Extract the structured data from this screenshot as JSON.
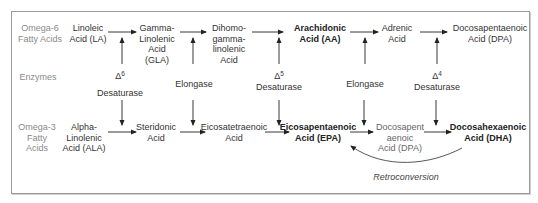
{
  "rows": {
    "omega6_label": [
      "Omega-6",
      "Fatty Acids"
    ],
    "enzymes_label": "Enzymes",
    "omega3_label": [
      "Omega-3",
      "Fatty",
      "Acids"
    ]
  },
  "omega6": [
    {
      "lines": [
        "Linoleic",
        "Acid (LA)"
      ],
      "bold": false
    },
    {
      "lines": [
        "Gamma-",
        "Linolenic",
        "Acid",
        "(GLA)"
      ],
      "bold": false
    },
    {
      "lines": [
        "Dihomo-",
        "gamma-",
        "linolenic",
        "Acid"
      ],
      "bold": false
    },
    {
      "lines": [
        "Arachidonic",
        "Acid (AA)"
      ],
      "bold": true
    },
    {
      "lines": [
        "Adrenic",
        "Acid"
      ],
      "bold": false
    },
    {
      "lines": [
        "Docosapentaenoic",
        "Acid (DPA)"
      ],
      "bold": false
    }
  ],
  "enzymes": [
    {
      "symbol": "Δ",
      "sup": "6",
      "name": "Desaturase"
    },
    {
      "name": "Elongase"
    },
    {
      "symbol": "Δ",
      "sup": "5",
      "name": "Desaturase"
    },
    {
      "name": "Elongase"
    },
    {
      "symbol": "Δ",
      "sup": "4",
      "name": "Desaturase"
    }
  ],
  "omega3": [
    {
      "lines": [
        "Alpha-",
        "Linolenic",
        "Acid (ALA)"
      ],
      "bold": false
    },
    {
      "lines": [
        "Steridonic",
        "Acid"
      ],
      "bold": false
    },
    {
      "lines": [
        "Eicosatetraenoic",
        "Acid"
      ],
      "bold": false
    },
    {
      "lines": [
        "Eicosapentaenoic",
        "Acid (EPA)"
      ],
      "bold": true
    },
    {
      "lines": [
        "Docosapent",
        "aenoic",
        "Acid (DPA)"
      ],
      "bold": false
    },
    {
      "lines": [
        "Docosahexaenoic",
        "Acid (DHA)"
      ],
      "bold": true
    }
  ],
  "retroconversion_label": "Retroconversion"
}
